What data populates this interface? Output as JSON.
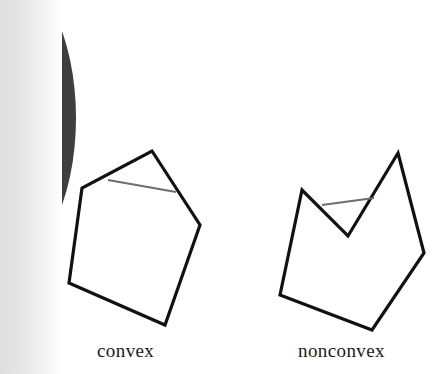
{
  "page": {
    "width": 436,
    "height": 374,
    "background_color": "#ffffff",
    "page_number": "5",
    "page_number_color": "#f2f2f2",
    "page_number_rotation_deg": 90
  },
  "scan_artifacts": {
    "dark_blob": {
      "name": "page-edge-shadow-blob",
      "color": "#3f3f3f",
      "shape": "ellipse",
      "cx": -2,
      "cy": 118,
      "rx": 78,
      "ry": 152
    },
    "left_margin_gradient": {
      "name": "scan-shadow-band",
      "from_color": "#dedede",
      "to_color": "#ffffff",
      "width": 62
    }
  },
  "figures": [
    {
      "id": "convex",
      "label": "convex",
      "label_x": 97,
      "label_y": 340,
      "outline_color": "#111111",
      "outline_width": 3.2,
      "chord_color": "#6e6e6e",
      "chord_width": 2.2,
      "vertices": [
        [
          152,
          151
        ],
        [
          200,
          225
        ],
        [
          165,
          325
        ],
        [
          69,
          283
        ],
        [
          82,
          188
        ]
      ],
      "chord": [
        [
          108,
          180
        ],
        [
          176,
          192
        ]
      ]
    },
    {
      "id": "nonconvex",
      "label": "nonconvex",
      "label_x": 298,
      "label_y": 340,
      "outline_color": "#111111",
      "outline_width": 3.2,
      "chord_color": "#6e6e6e",
      "chord_width": 2.2,
      "vertices": [
        [
          398,
          153
        ],
        [
          424,
          253
        ],
        [
          372,
          330
        ],
        [
          280,
          295
        ],
        [
          302,
          190
        ],
        [
          348,
          236
        ]
      ],
      "reflex_vertex": [
        348,
        236
      ],
      "chord": [
        [
          322,
          205
        ],
        [
          374,
          198
        ]
      ]
    }
  ],
  "labels": {
    "convex": "convex",
    "nonconvex": "nonconvex"
  },
  "colors": {
    "ink": "#111111",
    "chord_gray": "#6e6e6e",
    "blob_dark": "#3f3f3f",
    "paper": "#ffffff"
  }
}
